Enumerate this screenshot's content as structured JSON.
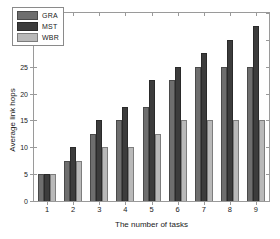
{
  "chart_data": {
    "type": "bar",
    "title": "",
    "subtitle": "",
    "xlabel": "The number of tasks",
    "ylabel": "Average link hops",
    "categories": [
      "1",
      "2",
      "3",
      "4",
      "5",
      "6",
      "7",
      "8",
      "9"
    ],
    "series": [
      {
        "name": "GRA",
        "color": "#6e6e6e",
        "values": [
          5,
          7.5,
          12.5,
          15,
          17.5,
          22.5,
          25,
          25,
          25
        ]
      },
      {
        "name": "MST",
        "color": "#3c3c3c",
        "values": [
          5,
          10,
          15,
          17.5,
          22.5,
          25,
          27.5,
          30,
          32.5
        ]
      },
      {
        "name": "WBR",
        "color": "#b9b9b9",
        "values": [
          5,
          7.5,
          10,
          10,
          12.5,
          15,
          15,
          15,
          15
        ]
      }
    ],
    "ylim": [
      0,
      35
    ],
    "yticks": [
      0,
      5,
      10,
      15,
      20,
      25,
      30,
      35
    ],
    "ytick_labels": [
      "0",
      "5",
      "10",
      "15",
      "20",
      "25",
      "30",
      "35"
    ],
    "xtick_labels": [
      "1",
      "2",
      "3",
      "4",
      "5",
      "6",
      "7",
      "8",
      "9"
    ],
    "grid": false,
    "legend_position": "upper-left",
    "legend_entries": [
      "GRA",
      "MST",
      "WBR"
    ],
    "annotations": []
  }
}
